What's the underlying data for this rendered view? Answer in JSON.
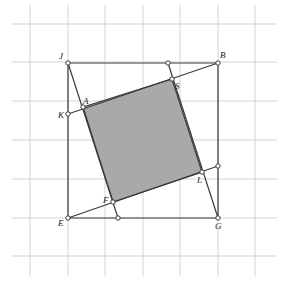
{
  "caption": "",
  "grid": {
    "vertical_x": [
      30,
      68,
      105,
      143,
      180,
      218,
      255
    ],
    "horizontal_y": [
      24,
      62,
      101,
      140,
      179,
      218,
      256
    ],
    "x_extent": [
      12,
      277
    ],
    "y_extent": [
      5,
      276
    ],
    "color": "#d4d4d4"
  },
  "shade_color": "#a9a9a9",
  "points": {
    "J": {
      "label": "J",
      "x": 68,
      "y": 63
    },
    "B": {
      "label": "B",
      "x": 218,
      "y": 63
    },
    "E": {
      "label": "E",
      "x": 68,
      "y": 218
    },
    "G": {
      "label": "G",
      "x": 218,
      "y": 218
    },
    "K": {
      "label": "K",
      "x": 68,
      "y": 114
    },
    "A": {
      "label": "A",
      "x": 83,
      "y": 107
    },
    "S": {
      "label": "S",
      "x": 172,
      "y": 79
    },
    "L": {
      "label": "L",
      "x": 202,
      "y": 172
    },
    "F": {
      "label": "F",
      "x": 113,
      "y": 202
    },
    "T": {
      "label": "",
      "x": 168,
      "y": 63
    },
    "R": {
      "label": "",
      "x": 218,
      "y": 166
    },
    "M": {
      "label": "",
      "x": 118,
      "y": 218
    }
  },
  "labels": {
    "J": "J",
    "B": "B",
    "E": "E",
    "G": "G",
    "K": "K",
    "A": "A",
    "S": "S",
    "L": "L",
    "F": "F"
  }
}
